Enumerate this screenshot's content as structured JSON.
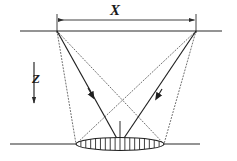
{
  "figure": {
    "kind": "ray-path-geometry-diagram",
    "background_color": "#ffffff",
    "line_color": "#2b2b2b",
    "dotted_color": "#555555"
  },
  "labels": {
    "horizontal_distance": "X",
    "depth_axis": "Z"
  },
  "surface_line": {
    "name": "upper-surface-line",
    "x1": 20,
    "y1": 31,
    "x2": 222,
    "y2": 31
  },
  "base_line": {
    "name": "lower-reflector-line",
    "x1": 10,
    "y1": 144,
    "x2": 200,
    "y2": 144
  },
  "dimension": {
    "name": "x-dimension-line",
    "y": 20,
    "x_start": 57,
    "x_end": 196,
    "arrow_both_ends": true
  },
  "depth_arrow": {
    "name": "z-depth-arrow",
    "x": 34,
    "y_start": 62,
    "y_end": 106,
    "direction": "down"
  },
  "stations": [
    {
      "name": "left-station",
      "x": 57,
      "y": 31
    },
    {
      "name": "right-station",
      "x": 196,
      "y": 31
    }
  ],
  "target": {
    "name": "hatched-ellipse-target",
    "cx": 120,
    "cy": 144,
    "rx": 44,
    "ry": 6.5,
    "hatch_count": 17,
    "left_edge_x": 76,
    "right_edge_x": 164
  },
  "center_stem": {
    "name": "center-vertical-stem",
    "x": 120,
    "y_top": 121,
    "y_bottom": 144
  },
  "rays": {
    "solid": [
      {
        "name": "solid-ray-left-to-center",
        "x1": 57,
        "y1": 31,
        "x2": 120,
        "y2": 144,
        "arrow_at": 0.56
      },
      {
        "name": "solid-ray-right-to-center",
        "x1": 196,
        "y1": 31,
        "x2": 120,
        "y2": 144,
        "arrow_at": 0.56
      }
    ],
    "dotted": [
      {
        "name": "dotted-ray-left-outer",
        "x1": 57,
        "y1": 31,
        "x2": 76,
        "y2": 144
      },
      {
        "name": "dotted-ray-left-to-far-edge",
        "x1": 57,
        "y1": 31,
        "x2": 164,
        "y2": 144
      },
      {
        "name": "dotted-ray-right-outer",
        "x1": 196,
        "y1": 31,
        "x2": 164,
        "y2": 144
      },
      {
        "name": "dotted-ray-right-to-far-edge",
        "x1": 196,
        "y1": 31,
        "x2": 76,
        "y2": 144
      }
    ]
  }
}
